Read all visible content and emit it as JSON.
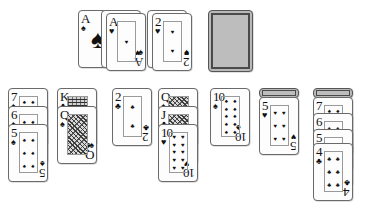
{
  "app": {
    "name": "Solitaire",
    "background_color": "#ffffff",
    "card_face_color": "#fdfdfd",
    "card_back_color": "#b9b9b9",
    "card_border_color": "#6a6a6a"
  },
  "foundations": {
    "label": "foundations",
    "piles": [
      {
        "name": "foundation-pile-1",
        "x": 78,
        "y": 10,
        "cards": [
          {
            "rank": "A",
            "suit": "♠",
            "suit_name": "spades",
            "face_up": true,
            "layout": "ace"
          }
        ]
      },
      {
        "name": "foundation-pile-2",
        "x": 106,
        "y": 13,
        "cards": [
          {
            "rank": "A",
            "suit": "♥",
            "suit_name": "hearts",
            "face_up": true,
            "layout": "ace-overlap",
            "overlap_suit": "♠"
          }
        ]
      },
      {
        "name": "foundation-pile-3",
        "x": 152,
        "y": 13,
        "cards": [
          {
            "rank": "2",
            "suit": "♥",
            "suit_name": "hearts",
            "face_up": true,
            "layout": "two",
            "overlap_suit": "♠"
          }
        ]
      }
    ]
  },
  "stock": {
    "name": "stock-pile",
    "x": 208,
    "y": 10,
    "face_down": true,
    "label": "stock"
  },
  "waste": {
    "name": "waste-pile",
    "label": "waste",
    "empty": true
  },
  "tableau": {
    "label": "tableau",
    "columns": [
      {
        "name": "tableau-column-1",
        "x": 8,
        "y": 88,
        "cards": [
          {
            "rank": "7",
            "suit": "♠",
            "suit_name": "spades",
            "face_up": true,
            "offset": 0
          },
          {
            "rank": "6",
            "suit": "♠",
            "suit_name": "spades",
            "face_up": true,
            "offset": 18
          },
          {
            "rank": "5",
            "suit": "♠",
            "suit_name": "spades",
            "face_up": true,
            "offset": 36
          }
        ]
      },
      {
        "name": "tableau-column-2",
        "x": 57,
        "y": 88,
        "cards": [
          {
            "rank": "K",
            "suit": "♣",
            "suit_name": "clubs",
            "face_up": true,
            "offset": 0,
            "court": true
          },
          {
            "rank": "Q",
            "suit": "♠",
            "suit_name": "spades",
            "face_up": true,
            "offset": 18,
            "court": true
          }
        ]
      },
      {
        "name": "tableau-column-3",
        "x": 112,
        "y": 88,
        "cards": [
          {
            "rank": "2",
            "suit": "♣",
            "suit_name": "clubs",
            "face_up": true,
            "offset": 0
          }
        ]
      },
      {
        "name": "tableau-column-4",
        "x": 158,
        "y": 88,
        "cards": [
          {
            "rank": "Q",
            "suit": "♠",
            "suit_name": "spades",
            "face_up": true,
            "offset": 0,
            "court": true
          },
          {
            "rank": "J",
            "suit": "♣",
            "suit_name": "clubs",
            "face_up": true,
            "offset": 18,
            "court": true
          },
          {
            "rank": "10",
            "suit": "♥",
            "suit_name": "hearts",
            "face_up": true,
            "offset": 36
          }
        ]
      },
      {
        "name": "tableau-column-5",
        "x": 210,
        "y": 88,
        "cards": [
          {
            "rank": "10",
            "suit": "♠",
            "suit_name": "spades",
            "face_up": true,
            "offset": 0
          }
        ]
      },
      {
        "name": "tableau-column-6",
        "x": 259,
        "y": 88,
        "cards": [
          {
            "rank": "",
            "suit": "",
            "suit_name": "",
            "face_up": false,
            "offset": 0
          },
          {
            "rank": "5",
            "suit": "♥",
            "suit_name": "hearts",
            "face_up": true,
            "offset": 9
          }
        ]
      },
      {
        "name": "tableau-column-7",
        "x": 313,
        "y": 88,
        "cards": [
          {
            "rank": "",
            "suit": "",
            "suit_name": "",
            "face_up": false,
            "offset": 0
          },
          {
            "rank": "7",
            "suit": "♠",
            "suit_name": "spades",
            "face_up": true,
            "offset": 9
          },
          {
            "rank": "6",
            "suit": "♣",
            "suit_name": "clubs",
            "face_up": true,
            "offset": 25
          },
          {
            "rank": "5",
            "suit": "♠",
            "suit_name": "spades",
            "face_up": true,
            "offset": 41
          },
          {
            "rank": "4",
            "suit": "♣",
            "suit_name": "clubs",
            "face_up": true,
            "offset": 55
          }
        ]
      }
    ]
  }
}
